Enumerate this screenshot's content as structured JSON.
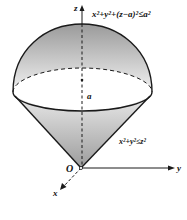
{
  "figure": {
    "type": "3d-solid-diagram",
    "labels": {
      "z_axis": "z",
      "y_axis": "y",
      "x_axis": "x",
      "origin": "O",
      "center": "a",
      "sphere_inequality": "x²+y²+(z−a)²≤a²",
      "cone_inequality": "x²+y²≤z²"
    },
    "colors": {
      "stroke": "#1a1a1a",
      "shade_dark": "#9a9a9a",
      "shade_light": "#f4f4f4"
    }
  }
}
